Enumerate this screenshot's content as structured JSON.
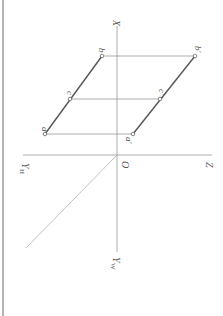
{
  "diagram": {
    "type": "orthographic-projection",
    "orientation": "rotated-90-clockwise",
    "axes": {
      "x_label": "X",
      "z_label": "Z",
      "yh_label": "Y",
      "yh_sub": "H",
      "yw_label": "Y",
      "yw_sub": "W",
      "origin_label": "O"
    },
    "points": {
      "a": {
        "label": "a",
        "x": 45,
        "y": 134
      },
      "b": {
        "label": "b",
        "x": 102,
        "y": 56
      },
      "c": {
        "label": "c",
        "x": 70,
        "y": 99
      },
      "a_prime": {
        "label": "a′",
        "x": 133,
        "y": 134
      },
      "b_prime": {
        "label": "b′",
        "x": 195,
        "y": 56
      },
      "c_prime": {
        "label": "c′",
        "x": 160,
        "y": 99
      }
    },
    "colors": {
      "axis": "#9a9a9a",
      "projection_line": "#8a8a8a",
      "segment": "#555555",
      "point_fill": "#ffffff",
      "label": "#555555",
      "border": "#b4b4b4"
    }
  }
}
